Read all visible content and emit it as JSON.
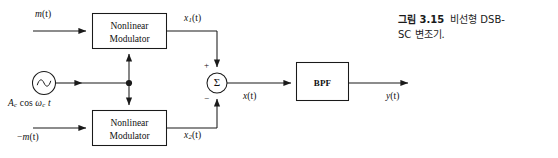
{
  "figure": {
    "name": "nonlinear-dsb-sc-modulator-block-diagram",
    "caption": {
      "label": "그림 3.15",
      "text": "비선형 DSB-SC SC 변조기.",
      "line1_label": "그림 3.15",
      "line1_rest": "비선형 DSB-",
      "line2": "SC 변조기."
    }
  },
  "blocks": {
    "modulator_top": {
      "line1": "Nonlinear",
      "line2": "Modulator"
    },
    "modulator_bottom": {
      "line1": "Nonlinear",
      "line2": "Modulator"
    },
    "bpf": {
      "label": "BPF"
    },
    "summer": {
      "symbol": "Σ",
      "plus": "+",
      "minus": "−"
    },
    "oscillator": {
      "symbol": "sine-source"
    }
  },
  "signals": {
    "input_top_base": "m",
    "input_top_arg": "(t)",
    "input_bottom_sign": "−",
    "input_bottom_base": "m",
    "input_bottom_arg": "(t)",
    "carrier_amp": "A",
    "carrier_amp_sub": "c",
    "carrier_cos": "cos",
    "carrier_omega": "ω",
    "carrier_omega_sub": "c",
    "carrier_time": "t",
    "x1_base": "x",
    "x1_sub": "1",
    "x1_arg": "(t)",
    "x2_base": "x",
    "x2_sub": "2",
    "x2_arg": "(t)",
    "x_base": "x",
    "x_arg": "(t)",
    "y_base": "y",
    "y_arg": "(t)"
  },
  "colors": {
    "stroke": "#1a1a1a",
    "background": "#ffffff",
    "text": "#111111"
  }
}
